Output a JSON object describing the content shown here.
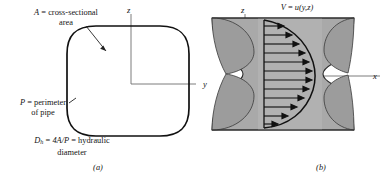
{
  "figure": {
    "panels": [
      {
        "id": "a",
        "caption": "(a)",
        "axes": {
          "vertical": "z",
          "horizontal": "y"
        },
        "shape": "rounded-square duct cross section",
        "labels": {
          "area": {
            "symbol": "A",
            "equals": "=",
            "text": "cross-sectional",
            "text2": "area"
          },
          "perimeter": {
            "symbol": "P",
            "equals": "=",
            "text": "perimeter",
            "text2": "of pipe"
          },
          "hydraulic_diameter": {
            "symbol": "D",
            "subscript": "h",
            "equals": "=",
            "formula": "4A/P",
            "equals2": "=",
            "text": "hydraulic",
            "text2": "diameter"
          }
        }
      },
      {
        "id": "b",
        "caption": "(b)",
        "axes": {
          "vertical": "z",
          "horizontal": "x"
        },
        "shape": "waisted hourglass duct with velocity profile",
        "labels": {
          "velocity": {
            "symbol": "V",
            "equals": "=",
            "expression": "u(y,z)"
          }
        },
        "profile": {
          "arrow_count": 12,
          "description": "developed velocity profile arrows"
        }
      }
    ],
    "colors": {
      "duct_fill": "#a8a8a8",
      "duct_fill_dark": "#9a9a9a",
      "duct_fill_light": "#c4c4c4",
      "outline": "#1a1a1a",
      "axis": "#6e6e6e",
      "background": "#ffffff"
    }
  }
}
